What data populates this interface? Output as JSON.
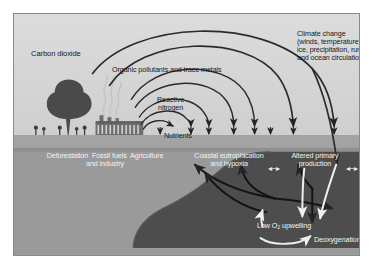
{
  "figure": {
    "domain": "diagram"
  },
  "labels": {
    "carbon_dioxide": "Carbon dioxide",
    "organic_pollutants": "Organic pollutants and trace metals",
    "reactive_nitrogen": "Reactive\nnitrogen",
    "nutrients": "Nutrients",
    "climate_change": "Climate change\n(winds, temperature, sea\nice, precipitation, runoff\nand ocean circulation)",
    "deforestation": "Deforestation  Fossil fuels  Agriculture\nand industry",
    "coastal_eutrophication": "Coastal eutrophication\nand hypoxia",
    "altered_primary_production": "Altered primary\nproduction",
    "ocean_uptake": "Ocean uptake\nand acidification",
    "low_o2_upwelling_pre": "Low O",
    "low_o2_upwelling_sub": "2",
    "low_o2_upwelling_post": " upwelling",
    "deoxygenation": "Deoxygenation",
    "connector_arrow": "◂─▸"
  },
  "colors": {
    "sky": "#d7d7d7",
    "land_strip": "#a2a2a2",
    "shelf_water": "#9c9c9c",
    "deep_ocean": "#4c4c4c",
    "arc_arrow": "#2b2b2b",
    "light_arrow": "#f0f0f0",
    "frame_border": "#8a8a8a",
    "page_background": "#ffffff",
    "dark_text": "#17191b",
    "light_text": "#f2f3f3"
  },
  "scene": {
    "tree": "tree-silhouette",
    "factory": "factory-silhouette",
    "smoke": "smoke-plume",
    "crops": "crop-row",
    "people": "people-silhouettes"
  }
}
